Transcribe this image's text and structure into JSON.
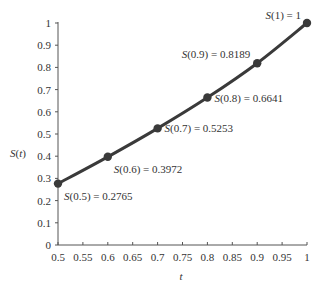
{
  "chart_data": {
    "type": "line",
    "title": "",
    "xlabel": "t",
    "ylabel": "S(t)",
    "xlim": [
      0.5,
      1
    ],
    "ylim": [
      0,
      1
    ],
    "grid": false,
    "x_ticks": [
      "0.5",
      "0.55",
      "0.6",
      "0.65",
      "0.7",
      "0.75",
      "0.8",
      "0.85",
      "0.9",
      "0.95",
      "1"
    ],
    "y_ticks": [
      "0",
      "0.1",
      "0.2",
      "0.3",
      "0.4",
      "0.5",
      "0.6",
      "0.7",
      "0.8",
      "0.9",
      "1"
    ],
    "series": [
      {
        "name": "S(t)",
        "color": "#3a3a3a",
        "x": [
          0.5,
          0.6,
          0.7,
          0.8,
          0.9,
          1.0
        ],
        "values": [
          0.2765,
          0.3972,
          0.5253,
          0.6641,
          0.8189,
          1.0
        ]
      }
    ],
    "annotations": [
      {
        "fn": "S",
        "arg": "(0.5) = 0.2765",
        "x": 0.5,
        "y": 0.2765,
        "pos": "below-right"
      },
      {
        "fn": "S",
        "arg": "(0.6) = 0.3972",
        "x": 0.6,
        "y": 0.3972,
        "pos": "below-right"
      },
      {
        "fn": "S",
        "arg": "(0.7) = 0.5253",
        "x": 0.7,
        "y": 0.5253,
        "pos": "right"
      },
      {
        "fn": "S",
        "arg": "(0.8) = 0.6641",
        "x": 0.8,
        "y": 0.6641,
        "pos": "right"
      },
      {
        "fn": "S",
        "arg": "(0.9) = 0.8189",
        "x": 0.9,
        "y": 0.8189,
        "pos": "left"
      },
      {
        "fn": "S",
        "arg": "(1) = 1",
        "x": 1.0,
        "y": 1.0,
        "pos": "left"
      }
    ]
  },
  "labels": {
    "ylabel_fn": "S",
    "ylabel_rest": "(",
    "ylabel_var": "t",
    "ylabel_close": ")",
    "xlabel": "t"
  }
}
